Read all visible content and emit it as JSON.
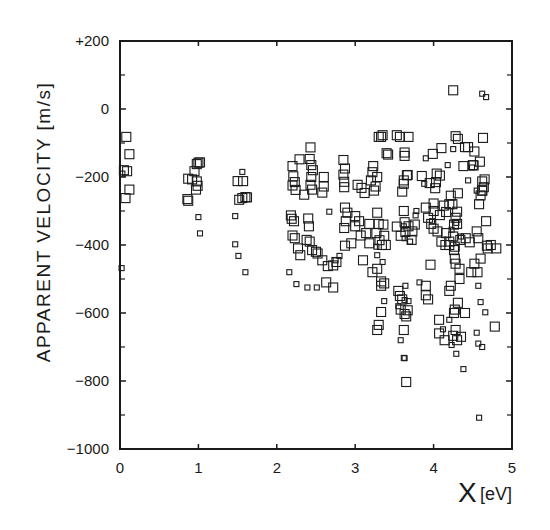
{
  "chart_data": {
    "type": "scatter",
    "title": "",
    "xlabel": "X",
    "xlabel_unit": "[eV]",
    "ylabel": "APPARENT VELOCITY [m/s]",
    "xlim": [
      0,
      5
    ],
    "ylim": [
      -1000,
      200
    ],
    "x_ticks": [
      0,
      1,
      2,
      3,
      4,
      5
    ],
    "x_tick_labels": [
      "0",
      "1",
      "2",
      "3",
      "4",
      "5"
    ],
    "y_ticks": [
      200,
      0,
      -200,
      -400,
      -600,
      -800,
      -1000
    ],
    "y_tick_labels": [
      "+200",
      "0",
      "−200",
      "−400",
      "−600",
      "−800",
      "−1000"
    ],
    "y_minor_ticks": [
      100,
      -100,
      -300,
      -500,
      -700,
      -900
    ],
    "grid": false,
    "legend": null,
    "marker": "open-square",
    "marker_color": "#1a1a1a",
    "note": "Marker size varies (large vs small squares); values read off the plot, approximate.",
    "series": [
      {
        "name": "large-squares",
        "points": [
          [
            0.08,
            -82
          ],
          [
            0.12,
            -133
          ],
          [
            0.05,
            -180
          ],
          [
            0.09,
            -183
          ],
          [
            0.12,
            -237
          ],
          [
            0.07,
            -262
          ],
          [
            0.87,
            -205
          ],
          [
            0.95,
            -183
          ],
          [
            0.98,
            -162
          ],
          [
            1.0,
            -158
          ],
          [
            1.02,
            -157
          ],
          [
            0.92,
            -207
          ],
          [
            0.98,
            -213
          ],
          [
            0.99,
            -226
          ],
          [
            0.97,
            -237
          ],
          [
            0.86,
            -265
          ],
          [
            0.87,
            -270
          ],
          [
            1.5,
            -212
          ],
          [
            1.57,
            -212
          ],
          [
            1.52,
            -267
          ],
          [
            1.56,
            -262
          ],
          [
            1.6,
            -259
          ],
          [
            1.62,
            -260
          ],
          [
            2.2,
            -168
          ],
          [
            2.21,
            -198
          ],
          [
            2.23,
            -215
          ],
          [
            2.2,
            -225
          ],
          [
            2.24,
            -238
          ],
          [
            2.18,
            -313
          ],
          [
            2.22,
            -330
          ],
          [
            2.2,
            -372
          ],
          [
            2.23,
            -380
          ],
          [
            2.19,
            -323
          ],
          [
            2.43,
            -113
          ],
          [
            2.42,
            -147
          ],
          [
            2.44,
            -165
          ],
          [
            2.46,
            -180
          ],
          [
            2.44,
            -200
          ],
          [
            2.43,
            -223
          ],
          [
            2.45,
            -237
          ],
          [
            2.6,
            -200
          ],
          [
            2.6,
            -228
          ],
          [
            2.58,
            -246
          ],
          [
            2.29,
            -148
          ],
          [
            2.35,
            -252
          ],
          [
            2.4,
            -322
          ],
          [
            2.41,
            -345
          ],
          [
            2.38,
            -385
          ],
          [
            2.42,
            -390
          ],
          [
            2.85,
            -150
          ],
          [
            2.87,
            -175
          ],
          [
            2.85,
            -193
          ],
          [
            2.86,
            -214
          ],
          [
            2.86,
            -230
          ],
          [
            2.9,
            -305
          ],
          [
            2.88,
            -330
          ],
          [
            2.86,
            -350
          ],
          [
            2.87,
            -290
          ],
          [
            3.03,
            -223
          ],
          [
            3.0,
            -315
          ],
          [
            3.05,
            -330
          ],
          [
            3.12,
            -247
          ],
          [
            3.23,
            -168
          ],
          [
            3.22,
            -186
          ],
          [
            3.2,
            -210
          ],
          [
            3.28,
            -200
          ],
          [
            3.26,
            -228
          ],
          [
            3.24,
            -240
          ],
          [
            3.28,
            -305
          ],
          [
            3.3,
            -338
          ],
          [
            3.27,
            -365
          ],
          [
            3.31,
            -386
          ],
          [
            3.36,
            -340
          ],
          [
            3.37,
            -373
          ],
          [
            3.34,
            -400
          ],
          [
            3.35,
            -77
          ],
          [
            3.33,
            -82
          ],
          [
            3.3,
            -82
          ],
          [
            3.4,
            -130
          ],
          [
            3.42,
            -134
          ],
          [
            3.53,
            -77
          ],
          [
            3.57,
            -82
          ],
          [
            3.68,
            -82
          ],
          [
            3.63,
            -128
          ],
          [
            3.63,
            -138
          ],
          [
            3.08,
            -232
          ],
          [
            3.18,
            -338
          ],
          [
            3.62,
            -220
          ],
          [
            3.67,
            -194
          ],
          [
            3.66,
            -195
          ],
          [
            3.62,
            -210
          ],
          [
            3.6,
            -243
          ],
          [
            3.62,
            -300
          ],
          [
            3.63,
            -333
          ],
          [
            3.64,
            -362
          ],
          [
            2.87,
            -402
          ],
          [
            2.95,
            -395
          ],
          [
            3.07,
            -372
          ],
          [
            3.14,
            -365
          ],
          [
            3.18,
            -395
          ],
          [
            3.1,
            -445
          ],
          [
            3.22,
            -480
          ],
          [
            3.28,
            -470
          ],
          [
            3.39,
            -400
          ],
          [
            2.76,
            -450
          ],
          [
            2.72,
            -460
          ],
          [
            2.58,
            -445
          ],
          [
            2.65,
            -462
          ],
          [
            2.45,
            -415
          ],
          [
            2.5,
            -420
          ],
          [
            2.52,
            -425
          ],
          [
            3.58,
            -373
          ],
          [
            3.53,
            -346
          ],
          [
            3.68,
            -345
          ],
          [
            3.73,
            -360
          ],
          [
            3.76,
            -340
          ],
          [
            3.72,
            -385
          ],
          [
            2.27,
            -410
          ],
          [
            2.3,
            -430
          ],
          [
            2.63,
            -510
          ],
          [
            2.72,
            -525
          ],
          [
            3.0,
            -345
          ],
          [
            3.33,
            -507
          ],
          [
            3.33,
            -597
          ],
          [
            3.37,
            -513
          ],
          [
            3.33,
            -520
          ],
          [
            3.63,
            -603
          ],
          [
            3.6,
            -560
          ],
          [
            3.65,
            -610
          ],
          [
            3.58,
            -590
          ],
          [
            3.85,
            -197
          ],
          [
            3.95,
            -218
          ],
          [
            4.02,
            -233
          ],
          [
            4.08,
            -196
          ],
          [
            4.03,
            -215
          ],
          [
            4.0,
            -278
          ],
          [
            4.08,
            -312
          ],
          [
            4.13,
            -284
          ],
          [
            4.16,
            -303
          ],
          [
            3.99,
            -132
          ],
          [
            4.04,
            -190
          ],
          [
            4.1,
            -115
          ],
          [
            4.05,
            -360
          ],
          [
            4.1,
            -390
          ],
          [
            4.16,
            -365
          ],
          [
            4.2,
            -400
          ],
          [
            4.26,
            -415
          ],
          [
            4.28,
            -455
          ],
          [
            3.97,
            -338
          ],
          [
            4.0,
            -352
          ],
          [
            4.0,
            -300
          ],
          [
            3.9,
            -290
          ],
          [
            3.93,
            -320
          ],
          [
            3.96,
            -458
          ],
          [
            4.25,
            55
          ],
          [
            4.28,
            -80
          ],
          [
            4.31,
            -88
          ],
          [
            4.44,
            -112
          ],
          [
            4.52,
            -125
          ],
          [
            4.5,
            -165
          ],
          [
            4.4,
            -112
          ],
          [
            4.38,
            -168
          ],
          [
            4.51,
            -166
          ],
          [
            4.63,
            -85
          ],
          [
            4.59,
            -155
          ],
          [
            4.62,
            -213
          ],
          [
            4.65,
            -207
          ],
          [
            4.62,
            -240
          ],
          [
            4.6,
            -254
          ],
          [
            4.67,
            -330
          ],
          [
            4.64,
            -230
          ],
          [
            4.58,
            -280
          ],
          [
            4.3,
            -338
          ],
          [
            4.34,
            -385
          ],
          [
            4.41,
            -380
          ],
          [
            4.46,
            -392
          ],
          [
            4.2,
            -280
          ],
          [
            4.22,
            -255
          ],
          [
            4.31,
            -248
          ],
          [
            4.24,
            -280
          ],
          [
            4.3,
            -302
          ],
          [
            4.28,
            -320
          ],
          [
            4.27,
            -440
          ],
          [
            4.33,
            -470
          ],
          [
            4.55,
            -360
          ],
          [
            4.57,
            -380
          ],
          [
            4.69,
            -410
          ],
          [
            4.68,
            -402
          ],
          [
            4.73,
            -400
          ],
          [
            4.8,
            -410
          ],
          [
            4.26,
            -340
          ],
          [
            4.25,
            -375
          ],
          [
            4.27,
            -405
          ],
          [
            4.33,
            -500
          ],
          [
            4.27,
            -590
          ],
          [
            4.28,
            -650
          ],
          [
            4.25,
            -667
          ],
          [
            4.3,
            -680
          ],
          [
            4.35,
            -670
          ],
          [
            4.14,
            -680
          ],
          [
            4.07,
            -620
          ],
          [
            4.07,
            -660
          ],
          [
            4.22,
            -520
          ],
          [
            4.2,
            -535
          ],
          [
            4.26,
            -600
          ],
          [
            4.4,
            -600
          ],
          [
            4.31,
            -570
          ],
          [
            4.56,
            -480
          ],
          [
            4.6,
            -440
          ],
          [
            4.48,
            -480
          ],
          [
            4.52,
            -455
          ],
          [
            4.78,
            -640
          ],
          [
            4.62,
            -240
          ],
          [
            3.55,
            -535
          ],
          [
            3.57,
            -550
          ],
          [
            3.67,
            -592
          ],
          [
            3.9,
            -548
          ],
          [
            3.93,
            -560
          ],
          [
            3.9,
            -520
          ],
          [
            4.15,
            -400
          ],
          [
            4.2,
            -390
          ],
          [
            3.65,
            -803
          ],
          [
            3.62,
            -650
          ],
          [
            3.28,
            -650
          ],
          [
            3.3,
            -635
          ]
        ]
      },
      {
        "name": "small-squares",
        "points": [
          [
            0.02,
            -468
          ],
          [
            0.03,
            -190
          ],
          [
            1.0,
            -318
          ],
          [
            1.02,
            -366
          ],
          [
            1.47,
            -315
          ],
          [
            1.47,
            -398
          ],
          [
            1.51,
            -432
          ],
          [
            1.6,
            -480
          ],
          [
            1.56,
            -185
          ],
          [
            2.16,
            -480
          ],
          [
            2.25,
            -515
          ],
          [
            2.39,
            -525
          ],
          [
            2.51,
            -525
          ],
          [
            2.67,
            -302
          ],
          [
            2.8,
            -432
          ],
          [
            2.75,
            -445
          ],
          [
            3.27,
            -405
          ],
          [
            3.28,
            -430
          ],
          [
            3.35,
            -450
          ],
          [
            3.37,
            -565
          ],
          [
            3.68,
            -565
          ],
          [
            3.62,
            -345
          ],
          [
            3.63,
            -380
          ],
          [
            3.64,
            -520
          ],
          [
            3.63,
            -562
          ],
          [
            3.9,
            -145
          ],
          [
            3.88,
            -220
          ],
          [
            3.77,
            -313
          ],
          [
            3.78,
            -300
          ],
          [
            3.82,
            -510
          ],
          [
            3.98,
            -330
          ],
          [
            4.18,
            -165
          ],
          [
            4.25,
            -118
          ],
          [
            4.44,
            -210
          ],
          [
            4.49,
            -172
          ],
          [
            4.62,
            45
          ],
          [
            4.67,
            35
          ],
          [
            4.29,
            -335
          ],
          [
            4.23,
            -355
          ],
          [
            4.35,
            -375
          ],
          [
            4.55,
            -240
          ],
          [
            4.57,
            -520
          ],
          [
            4.6,
            -568
          ],
          [
            4.66,
            -598
          ],
          [
            4.55,
            -658
          ],
          [
            4.57,
            -690
          ],
          [
            4.62,
            -700
          ],
          [
            3.62,
            -732
          ],
          [
            3.63,
            -733
          ],
          [
            3.58,
            -680
          ],
          [
            3.55,
            -580
          ],
          [
            3.7,
            -390
          ],
          [
            4.58,
            -908
          ],
          [
            4.12,
            -648
          ],
          [
            4.2,
            -620
          ],
          [
            4.23,
            -694
          ],
          [
            4.38,
            -765
          ],
          [
            4.29,
            -720
          ]
        ]
      }
    ]
  }
}
